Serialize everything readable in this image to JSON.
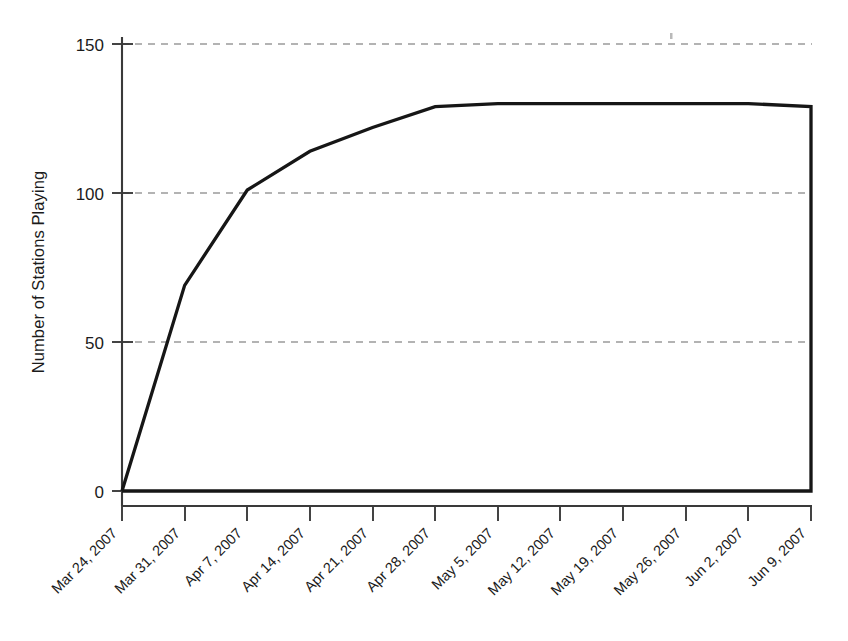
{
  "chart_data": {
    "type": "line",
    "title": "",
    "subtitle": "",
    "xlabel": "",
    "ylabel": "Number of Stations Playing",
    "categories": [
      "Mar 24, 2007",
      "Mar 31, 2007",
      "Apr 7, 2007",
      "Apr 14, 2007",
      "Apr 21, 2007",
      "Apr 28, 2007",
      "May 5, 2007",
      "May 12, 2007",
      "May 19, 2007",
      "May 26, 2007",
      "Jun 2, 2007",
      "Jun 9, 2007"
    ],
    "values": [
      0,
      69,
      101,
      114,
      122,
      129,
      130,
      130,
      130,
      130,
      130,
      129
    ],
    "series": [
      {
        "name": "Number of Stations Playing",
        "values": [
          0,
          69,
          101,
          114,
          122,
          129,
          130,
          130,
          130,
          130,
          130,
          129
        ]
      }
    ],
    "ylim": [
      0,
      150
    ],
    "yticks": [
      0,
      50,
      100,
      150
    ],
    "ytick_labels": [
      "0",
      "50",
      "100",
      "150"
    ],
    "grid": "horizontal-dashed",
    "legend": "none",
    "line_color": "#161616",
    "grid_color": "#9a9a9a",
    "axis_color": "#3a3a3a",
    "baseline_closed": true
  },
  "axis": {
    "y_title": "Number of Stations Playing",
    "x_label_rotation": "45"
  }
}
